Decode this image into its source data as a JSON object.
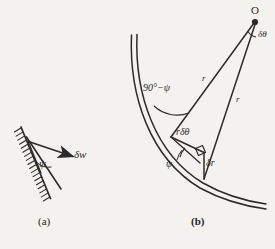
{
  "figure": {
    "background_color": "#f3f2ee",
    "ink_color": "#2b2b2b",
    "width": 275,
    "height": 249,
    "panels": [
      {
        "id": "a",
        "caption": "(a)",
        "description": "hatched-wall-with-displacement-vector",
        "labels": {
          "displacement": "δw",
          "angle": "ψ"
        }
      },
      {
        "id": "b",
        "caption": "(b)",
        "description": "curve-with-radial-lines-to-point-O",
        "labels": {
          "origin": "O",
          "delta_theta": "δθ",
          "radius_upper": "r",
          "radius_lower": "r",
          "arc_length": "rδθ",
          "delta_r": "δr",
          "angle_psi": "ψ",
          "angle_complement": "90°−ψ"
        }
      }
    ]
  },
  "chart_data": {
    "type": "diagram",
    "title": "",
    "panel_a": {
      "wall": {
        "x1": 21,
        "y1": 128,
        "x2": 50,
        "y2": 197,
        "hatched_side": "upper-left",
        "hatch_count": 18
      },
      "wedge_apex": {
        "x": 40,
        "y": 172
      },
      "wedge_upper": {
        "x": 26,
        "y": 138
      },
      "wedge_lower": {
        "x": 60,
        "y": 188
      },
      "vector": {
        "from_x": 28,
        "from_y": 142,
        "to_x": 77,
        "to_y": 158,
        "label": "δw"
      },
      "angle_label": {
        "x": 42,
        "y": 163,
        "text": "ψ"
      }
    },
    "panel_b": {
      "origin": {
        "x": 255,
        "y": 22,
        "label": "O"
      },
      "curve": {
        "start_x": 133,
        "start_y": 35,
        "end_x": 265,
        "end_y": 206,
        "double_line": true,
        "gap": 3
      },
      "vertex_near": {
        "x": 171,
        "y": 137
      },
      "vertex_far": {
        "x": 204,
        "y": 178
      },
      "foot": {
        "x": 203,
        "y": 152
      },
      "radii": [
        {
          "from": "origin",
          "to": "vertex_near",
          "label": "r",
          "label_x": 205,
          "label_y": 80
        },
        {
          "from": "origin",
          "to": "vertex_far",
          "label": "r",
          "label_x": 235,
          "label_y": 101
        }
      ],
      "arc_segment": {
        "label": "rδθ",
        "label_x": 182,
        "label_y": 134
      },
      "delta_r_segment": {
        "label": "δr",
        "label_x": 208,
        "label_y": 164
      },
      "right_angle_marker": {
        "x": 197,
        "y": 146,
        "size": 9
      },
      "psi_arc_label": {
        "x": 171,
        "y": 165,
        "text": "ψ"
      },
      "complement_arc_label": {
        "x": 152,
        "y": 89,
        "text": "90°−ψ"
      },
      "delta_theta_label": {
        "x": 258,
        "y": 35,
        "text": "δθ"
      }
    }
  }
}
